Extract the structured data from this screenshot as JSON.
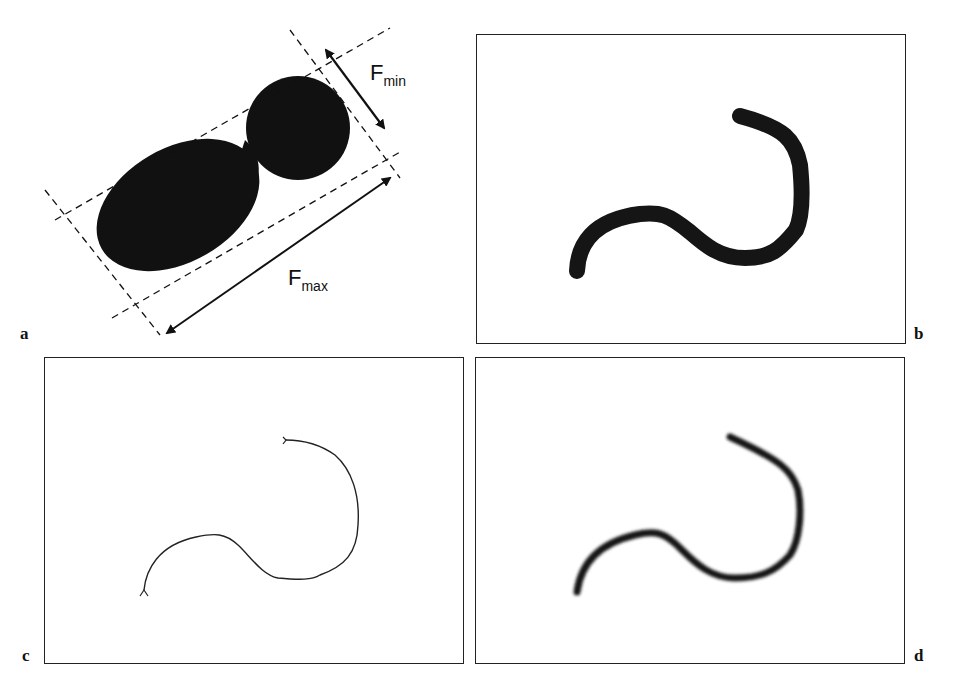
{
  "figure": {
    "panels": [
      {
        "id": "a",
        "label": "a",
        "description": "Feret diameters of a blob shape"
      },
      {
        "id": "b",
        "label": "b",
        "description": "Thick curved binary object"
      },
      {
        "id": "c",
        "label": "c",
        "description": "Skeleton (thin line) of object"
      },
      {
        "id": "d",
        "label": "d",
        "description": "Blurred version of object"
      }
    ],
    "annotations": {
      "fmin": {
        "base": "F",
        "sub": "min"
      },
      "fmax": {
        "base": "F",
        "sub": "max"
      }
    },
    "colors": {
      "ink": "#111111",
      "frame": "#222222",
      "background": "#ffffff"
    }
  }
}
